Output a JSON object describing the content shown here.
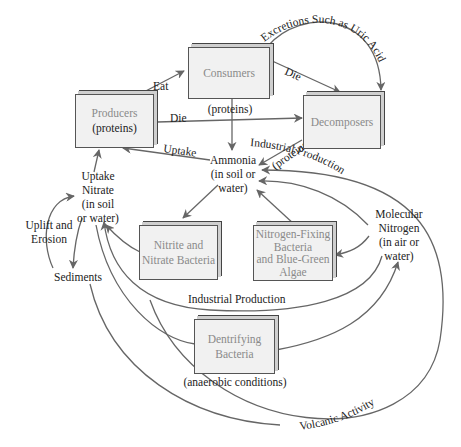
{
  "diagram": {
    "nodes": {
      "producers": {
        "label": "Producers",
        "sublabel": "(proteins)"
      },
      "consumers": {
        "label": "Consumers",
        "sublabel": "(proteins)"
      },
      "decomposers": {
        "label": "Decomposers",
        "sublabel": "(proteins)"
      },
      "ammonia": {
        "line1": "Ammonia",
        "line2": "(in soil or",
        "line3": "water)"
      },
      "nitrate": {
        "line0": "Uptake",
        "line1": "Nitrate",
        "line2": "(in soil",
        "line3": "or water)"
      },
      "nitrite_bacteria": {
        "line1": "Nitrite and",
        "line2": "Nitrate Bacteria"
      },
      "nitrogen_fixing": {
        "line1": "Nitrogen-Fixing",
        "line2": "Bacteria",
        "line3": "and Blue-Green",
        "line4": "Algae"
      },
      "molecular_nitrogen": {
        "line1": "Molecular",
        "line2": "Nitrogen",
        "line3": "(in air or",
        "line4": "water)"
      },
      "sediments": {
        "label": "Sediments"
      },
      "uplift": {
        "line1": "Uplift and",
        "line2": "Erosion"
      },
      "denitrifying": {
        "line1": "Dentrifying",
        "line2": "Bacteria",
        "sublabel": "(anaerobic conditions)"
      }
    },
    "edges": {
      "eat": "Eat",
      "die_consumers": "Die",
      "die_producers": "Die",
      "excretions": "Excretions Such as Uric Acid",
      "uptake_ammonia": "Uptake",
      "industrial_upper": "Industrial Production",
      "industrial_lower": "Industrial Production",
      "volcanic": "Volcanic Activity"
    },
    "colors": {
      "box_fill": "#f1f1f1",
      "box_text": "#8a8a8a",
      "arrow": "#666666",
      "text": "#222222"
    }
  }
}
